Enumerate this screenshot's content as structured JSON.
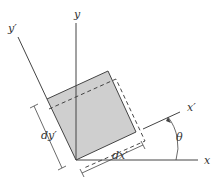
{
  "diagram": {
    "labels": {
      "x": "x",
      "y": "y",
      "x_prime": "x′",
      "y_prime": "y′",
      "theta": "θ",
      "dx_prime": "dx′",
      "dy_prime": "dy′"
    },
    "colors": {
      "element_fill": "#cfcfcf",
      "line": "#444444",
      "background": "#ffffff"
    },
    "rotation_angle_label": "θ"
  }
}
